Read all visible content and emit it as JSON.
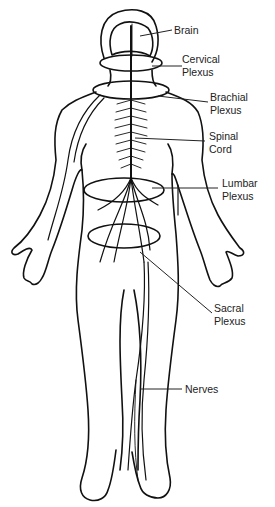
{
  "diagram": {
    "labels": {
      "brain": "Brain",
      "cervical_1": "Cervical",
      "cervical_2": "Plexus",
      "brachial_1": "Brachial",
      "brachial_2": "Plexus",
      "spinal_1": "Spinal",
      "spinal_2": "Cord",
      "lumbar_1": "Lumbar",
      "lumbar_2": "Plexus",
      "sacral_1": "Sacral",
      "sacral_2": "Plexus",
      "nerves": "Nerves"
    },
    "colors": {
      "stroke": "#111111",
      "text": "#222222",
      "background": "#ffffff"
    }
  }
}
